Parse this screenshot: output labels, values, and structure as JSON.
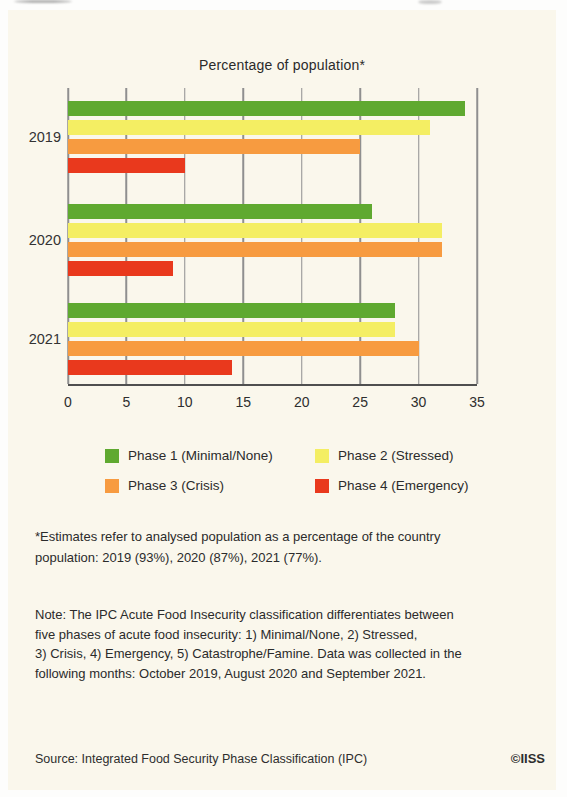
{
  "page": {
    "background_color": "#faf7ec",
    "text_color": "#2b2b2b"
  },
  "chart_data": {
    "type": "bar",
    "orientation": "horizontal",
    "title": "Percentage of population*",
    "categories": [
      "2019",
      "2020",
      "2021"
    ],
    "series": [
      {
        "name": "Phase 1 (Minimal/None)",
        "color": "#5fa930",
        "values": [
          34,
          26,
          28
        ]
      },
      {
        "name": "Phase 2 (Stressed)",
        "color": "#f4ee63",
        "values": [
          31,
          32,
          28
        ]
      },
      {
        "name": "Phase 3 (Crisis)",
        "color": "#f79b40",
        "values": [
          25,
          32,
          30
        ]
      },
      {
        "name": "Phase 4 (Emergency)",
        "color": "#e9391d",
        "values": [
          10,
          9,
          14
        ]
      }
    ],
    "xlim": [
      0,
      35
    ],
    "xticks": [
      0,
      5,
      10,
      15,
      20,
      25,
      30,
      35
    ],
    "grid": "vertical-gridlines",
    "gridline_color": "#8f8f8f",
    "legend_position": "bottom"
  },
  "footnote": "*Estimates refer to analysed population as a percentage of the country\npopulation: 2019 (93%), 2020 (87%), 2021 (77%).",
  "note": "Note: The IPC Acute Food Insecurity classification differentiates between\nfive phases of acute food insecurity: 1) Minimal/None, 2) Stressed,\n3) Crisis, 4) Emergency, 5) Catastrophe/Famine. Data was collected in the\nfollowing months: October 2019, August 2020 and September 2021.",
  "source": "Source: Integrated Food Security Phase Classification (IPC)",
  "credit": "©IISS"
}
